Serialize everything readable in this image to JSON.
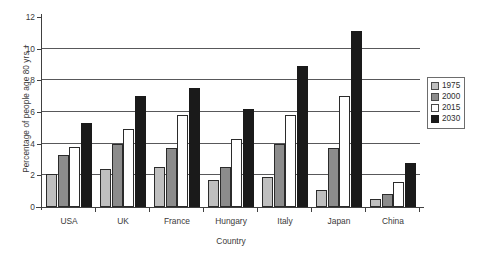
{
  "chart_data": {
    "type": "bar",
    "title": "",
    "xlabel": "Country",
    "ylabel": "Percentage of people age 80 yrs +",
    "ylim": [
      0,
      12
    ],
    "ytick_labels": [
      "0",
      "2",
      "4",
      "6",
      "8",
      "10",
      "12"
    ],
    "yticks": [
      0,
      2,
      4,
      6,
      8,
      10,
      12
    ],
    "grid": true,
    "grid_axis": "y",
    "legend_position": "right",
    "categories": [
      "USA",
      "UK",
      "France",
      "Hungary",
      "Italy",
      "Japan",
      "China"
    ],
    "series": [
      {
        "name": "1975",
        "color": "#bfbfbf",
        "values": [
          2.1,
          2.4,
          2.5,
          1.7,
          1.9,
          1.1,
          0.5
        ]
      },
      {
        "name": "2000",
        "color": "#8c8c8c",
        "values": [
          3.3,
          4.0,
          3.7,
          2.5,
          4.0,
          3.7,
          0.8
        ]
      },
      {
        "name": "2015",
        "color": "#ffffff",
        "values": [
          3.8,
          4.9,
          5.8,
          4.3,
          5.8,
          7.0,
          1.6
        ]
      },
      {
        "name": "2030",
        "color": "#1a1a1a",
        "values": [
          5.3,
          7.0,
          7.5,
          6.2,
          8.9,
          11.1,
          2.8
        ]
      }
    ]
  },
  "legend": {
    "items": [
      {
        "label": "1975"
      },
      {
        "label": "2000"
      },
      {
        "label": "2015"
      },
      {
        "label": "2030"
      }
    ]
  }
}
